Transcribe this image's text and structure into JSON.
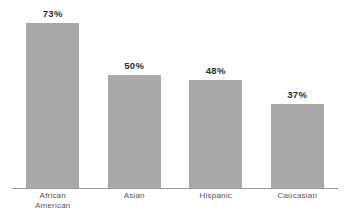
{
  "chart_data": {
    "type": "bar",
    "title": "",
    "subtitle": "",
    "xlabel": "",
    "ylabel": "",
    "ylim": [
      0,
      100
    ],
    "grid": false,
    "legend": "none",
    "axis_visible": "x-only",
    "categories": [
      "African American",
      "Asian",
      "Hispanic",
      "Caucasian"
    ],
    "category_lines": [
      [
        "African",
        "American"
      ],
      [
        "Asian",
        ""
      ],
      [
        "Hispanic",
        ""
      ],
      [
        "Caucasian",
        ""
      ]
    ],
    "values": [
      73,
      50,
      48,
      37
    ],
    "value_labels": [
      "73%",
      "50%",
      "48%",
      "37%"
    ],
    "bar_color": "#a8a8a8",
    "value_label_color": "#2e2e2e",
    "category_label_color": "#555555",
    "axis_color": "#9a9a9a",
    "background": "#ffffff"
  },
  "bars": [
    {
      "label": "73%",
      "value": 73,
      "cat_line1": "African",
      "cat_line2": "American"
    },
    {
      "label": "50%",
      "value": 50,
      "cat_line1": "Asian",
      "cat_line2": ""
    },
    {
      "label": "48%",
      "value": 48,
      "cat_line1": "Hispanic",
      "cat_line2": ""
    },
    {
      "label": "37%",
      "value": 37,
      "cat_line1": "Caucasian",
      "cat_line2": ""
    }
  ]
}
